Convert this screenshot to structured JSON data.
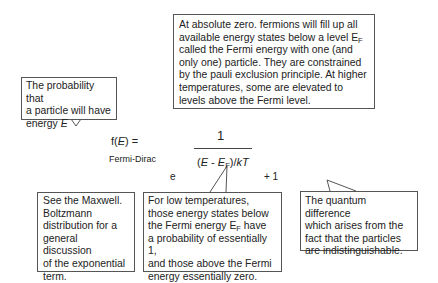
{
  "callouts": {
    "absolute_zero": {
      "lines": [
        "At absolute zero. fermions will fill up all",
        "available energy states below a level E",
        "called the Fermi energy with one (and",
        "only one) particle. They are constrained",
        "by the pauli exclusion principle. At higher",
        "temperatures, some are elevated to",
        "levels above the Fermi level."
      ],
      "sub_F": "F"
    },
    "probability": {
      "lines": [
        "The probability that",
        "a particle will have",
        "energy "
      ],
      "italic_E": "E"
    },
    "maxwell": {
      "lines": [
        "See the Maxwell.",
        "Boltzmann",
        "distribution for a",
        "general discussion",
        "of the exponential",
        "term."
      ]
    },
    "low_temp": {
      "lines": [
        "For low temperatures,",
        "those energy states below",
        "the Fermi energy E",
        "a probability of essentially 1,",
        "and those above the Fermi",
        "energy essentially zero."
      ],
      "sub_F": "F",
      "line3_suffix": " have"
    },
    "quantum": {
      "lines": [
        "The quantum difference",
        "which arises from the",
        "fact that the particles",
        "are indistinguishable."
      ]
    }
  },
  "formula": {
    "lhs_f": "f(",
    "lhs_E": "E",
    "lhs_close": ") =",
    "label": "Fermi-Dirac",
    "numerator": "1",
    "exp_open": "(",
    "exp_E": "E",
    "exp_minus": " - ",
    "exp_EF": "E",
    "exp_sub": "F",
    "exp_close": ")/",
    "exp_kT": "kT",
    "base": "e",
    "plus_one": "+ 1"
  }
}
